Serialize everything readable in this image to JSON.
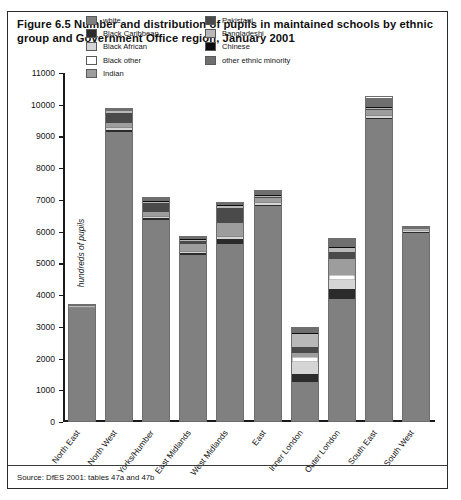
{
  "figure": {
    "title": "Figure 6.5 Number and distribution of pupils in maintained schools by ethnic group and Government Office region, January 2001",
    "source": "Source: DfES 2001: tables 47a and 47b"
  },
  "colors": {
    "white": "#808080",
    "black_caribbean": "#2b2b2b",
    "black_african": "#d5d5d5",
    "black_other": "#ffffff",
    "indian": "#9d9d9d",
    "pakistani": "#4a4a4a",
    "bangladeshi": "#b8b8b8",
    "chinese": "#0d0d0d",
    "other_ethnic_minority": "#6f6f6f",
    "axis": "#1a1a1a",
    "border": "#2b2b2b"
  },
  "legend": {
    "column_1": [
      {
        "label": "white",
        "key": "white"
      },
      {
        "label": "Black Caribbean",
        "key": "black_caribbean"
      },
      {
        "label": "Black African",
        "key": "black_african"
      },
      {
        "label": "Black other",
        "key": "black_other"
      },
      {
        "label": "Indian",
        "key": "indian"
      }
    ],
    "column_2": [
      {
        "label": "Pakistani",
        "key": "pakistani"
      },
      {
        "label": "Bangladeshi",
        "key": "bangladeshi"
      },
      {
        "label": "Chinese",
        "key": "chinese"
      },
      {
        "label": "other ethnic minority",
        "key": "other_ethnic_minority"
      }
    ]
  },
  "chart_data": {
    "type": "bar",
    "stacked": true,
    "title": "Figure 6.5 Number and distribution of pupils in maintained schools by ethnic group and Government Office region, January 2001",
    "xlabel": "",
    "ylabel": "hundreds of pupils",
    "ylim": [
      0,
      11000
    ],
    "ytick_step": 1000,
    "yticks": [
      0,
      1000,
      2000,
      3000,
      4000,
      5000,
      6000,
      7000,
      8000,
      9000,
      10000,
      11000
    ],
    "ytick_labels": [
      "0",
      "1000",
      "2000",
      "3000",
      "4000",
      "5000",
      "6000",
      "7000",
      "8000",
      "9000",
      "10000",
      "11000"
    ],
    "grid": false,
    "legend_position": "top-center",
    "categories": [
      "North East",
      "North West",
      "Yorks/Humber",
      "East Midlands",
      "West Midlands",
      "East",
      "Inner London",
      "Outer London",
      "South East",
      "South West"
    ],
    "series": [
      {
        "name": "white",
        "key": "white",
        "values": [
          3620,
          9180,
          6400,
          5300,
          5620,
          6830,
          1250,
          3900,
          9580,
          6000
        ]
      },
      {
        "name": "Black Caribbean",
        "key": "black_caribbean",
        "values": [
          10,
          60,
          50,
          50,
          170,
          40,
          260,
          300,
          40,
          20
        ]
      },
      {
        "name": "Black African",
        "key": "black_african",
        "values": [
          10,
          40,
          30,
          30,
          60,
          50,
          380,
          280,
          50,
          20
        ]
      },
      {
        "name": "Black other",
        "key": "black_other",
        "values": [
          10,
          40,
          30,
          30,
          50,
          40,
          170,
          160,
          40,
          20
        ]
      },
      {
        "name": "Indian",
        "key": "indian",
        "values": [
          10,
          120,
          150,
          220,
          400,
          120,
          140,
          520,
          140,
          20
        ]
      },
      {
        "name": "Pakistani",
        "key": "pakistani",
        "values": [
          10,
          320,
          280,
          120,
          480,
          40,
          170,
          240,
          60,
          10
        ]
      },
      {
        "name": "Bangladeshi",
        "key": "bangladeshi",
        "values": [
          5,
          60,
          40,
          20,
          60,
          40,
          420,
          100,
          30,
          10
        ]
      },
      {
        "name": "Chinese",
        "key": "chinese",
        "values": [
          5,
          20,
          20,
          20,
          20,
          20,
          40,
          60,
          30,
          10
        ]
      },
      {
        "name": "other ethnic minority",
        "key": "other_ethnic_minority",
        "values": [
          40,
          60,
          100,
          70,
          90,
          120,
          170,
          240,
          290,
          70
        ]
      }
    ],
    "totals": [
      3720,
      9900,
      7100,
      5860,
      6950,
      7300,
      3000,
      5800,
      10260,
      6180
    ]
  }
}
